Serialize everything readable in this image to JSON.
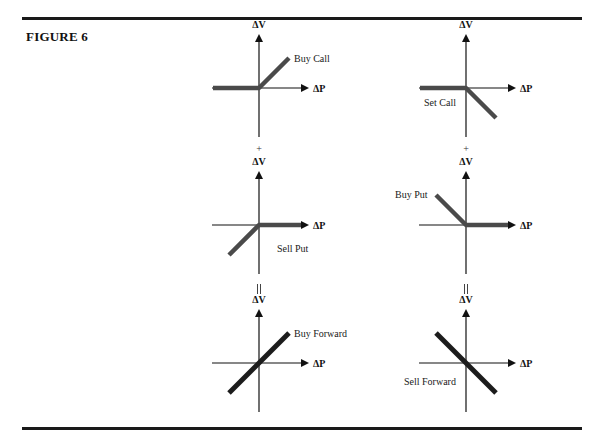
{
  "figure": {
    "title": "FIGURE 6"
  },
  "axes": {
    "x_label": "ΔP",
    "y_label": "ΔV"
  },
  "operators": {
    "row1_to_row2": "+",
    "row2_to_row3": "="
  },
  "colors": {
    "option_payoff": "#4a4a4a",
    "forward_payoff": "#1c1c1c",
    "axis": "#111111"
  },
  "panels": [
    {
      "id": "buy-call",
      "label": "Buy Call",
      "column": "left",
      "row": 1,
      "payoff": {
        "slope_left": 0,
        "slope_right": 1
      },
      "kind": "option"
    },
    {
      "id": "sell-call",
      "label": "Set Call",
      "column": "right",
      "row": 1,
      "payoff": {
        "slope_left": 0,
        "slope_right": -1
      },
      "kind": "option"
    },
    {
      "id": "sell-put",
      "label": "Sell Put",
      "column": "left",
      "row": 2,
      "payoff": {
        "slope_left": 1,
        "slope_right": 0
      },
      "kind": "option"
    },
    {
      "id": "buy-put",
      "label": "Buy Put",
      "column": "right",
      "row": 2,
      "payoff": {
        "slope_left": -1,
        "slope_right": 0
      },
      "kind": "option"
    },
    {
      "id": "buy-forward",
      "label": "Buy Forward",
      "column": "left",
      "row": 3,
      "payoff": {
        "slope_left": 1,
        "slope_right": 1
      },
      "kind": "forward"
    },
    {
      "id": "sell-forward",
      "label": "Sell Forward",
      "column": "right",
      "row": 3,
      "payoff": {
        "slope_left": -1,
        "slope_right": -1
      },
      "kind": "forward"
    }
  ]
}
